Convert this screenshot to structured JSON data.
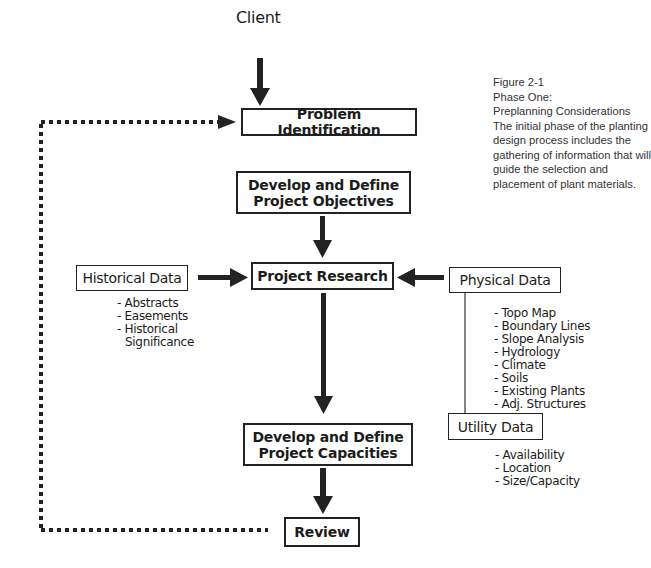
{
  "caption": {
    "figure": "Figure 2-1",
    "phase": "Phase One:",
    "title": "Preplanning Considerations",
    "description": "The initial phase of the planting design process includes the gathering of information that will guide the selection and placement of plant materials."
  },
  "nodes": {
    "client": "Client",
    "problem_identification": "Problem Identification",
    "objectives": {
      "line1": "Develop and Define",
      "line2": "Project Objectives"
    },
    "project_research": "Project Research",
    "historical_data": {
      "label": "Historical Data",
      "items": [
        "- Abstracts",
        "- Easements",
        "- Historical",
        "  Significance"
      ]
    },
    "physical_data": {
      "label": "Physical Data",
      "items": [
        "- Topo Map",
        "- Boundary Lines",
        "- Slope Analysis",
        "- Hydrology",
        "- Climate",
        "- Soils",
        "- Existing Plants",
        "- Adj. Structures"
      ]
    },
    "utility_data": {
      "label": "Utility Data",
      "items": [
        "- Availability",
        "- Location",
        "- Size/Capacity"
      ]
    },
    "capacities": {
      "line1": "Develop and Define",
      "line2": "Project Capacities"
    },
    "review": "Review"
  },
  "edges": [
    {
      "from": "client",
      "to": "problem_identification",
      "style": "solid-arrow"
    },
    {
      "from": "objectives",
      "to": "project_research",
      "style": "solid-arrow"
    },
    {
      "from": "historical_data",
      "to": "project_research",
      "style": "solid-arrow"
    },
    {
      "from": "physical_data",
      "to": "project_research",
      "style": "solid-arrow"
    },
    {
      "from": "physical_data",
      "to": "utility_data",
      "style": "thin-line"
    },
    {
      "from": "project_research",
      "to": "capacities",
      "style": "solid-arrow"
    },
    {
      "from": "capacities",
      "to": "review",
      "style": "solid-arrow"
    },
    {
      "from": "review",
      "to": "problem_identification",
      "style": "dotted-arrow"
    }
  ]
}
